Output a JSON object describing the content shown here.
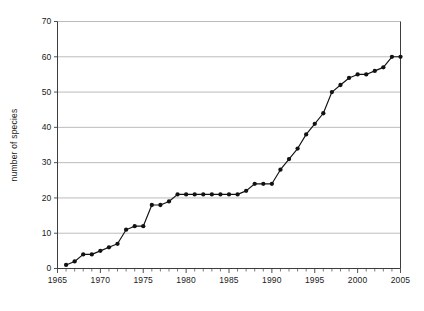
{
  "chart_data": {
    "type": "line",
    "title": "",
    "xlabel": "",
    "ylabel": "number of species",
    "xlim": [
      1965,
      2005
    ],
    "ylim": [
      0,
      70
    ],
    "grid": true,
    "legend": null,
    "y_ticks": [
      0,
      10,
      20,
      30,
      40,
      50,
      60,
      70
    ],
    "y_tick_labels": [
      "0",
      "10",
      "20",
      "30",
      "40",
      "50",
      "60",
      "70"
    ],
    "x_ticks": [
      1965,
      1970,
      1975,
      1980,
      1985,
      1990,
      1995,
      2000,
      2005
    ],
    "x_tick_labels": [
      "1965",
      "1970",
      "1975",
      "1980",
      "1985",
      "1990",
      "1995",
      "2000",
      "2005"
    ],
    "x_minor_tick_step": 1,
    "marker": "filled-circle",
    "line_color": "#121212",
    "grid_color": "#b4b4b4",
    "axis_color": "#3d3d3d",
    "x": [
      1966,
      1967,
      1968,
      1969,
      1970,
      1971,
      1972,
      1973,
      1974,
      1975,
      1976,
      1977,
      1978,
      1979,
      1980,
      1981,
      1982,
      1983,
      1984,
      1985,
      1986,
      1987,
      1988,
      1989,
      1990,
      1991,
      1992,
      1993,
      1994,
      1995,
      1996,
      1997,
      1998,
      1999,
      2000,
      2001,
      2002,
      2003,
      2004,
      2005
    ],
    "values": [
      1,
      2,
      4,
      4,
      5,
      6,
      7,
      11,
      12,
      12,
      18,
      18,
      19,
      21,
      21,
      21,
      21,
      21,
      21,
      21,
      21,
      22,
      24,
      24,
      24,
      28,
      31,
      34,
      38,
      41,
      44,
      50,
      52,
      54,
      55,
      55,
      56,
      57,
      60,
      60
    ],
    "series": [
      {
        "name": "number of species",
        "values": [
          1,
          2,
          4,
          4,
          5,
          6,
          7,
          11,
          12,
          12,
          18,
          18,
          19,
          21,
          21,
          21,
          21,
          21,
          21,
          21,
          21,
          22,
          24,
          24,
          24,
          28,
          31,
          34,
          38,
          41,
          44,
          50,
          52,
          54,
          55,
          55,
          56,
          57,
          60,
          60
        ]
      }
    ]
  }
}
